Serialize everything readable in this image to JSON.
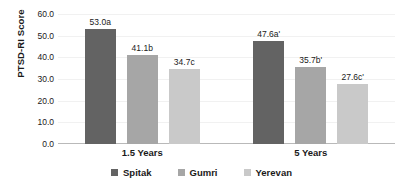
{
  "chart_data": {
    "type": "bar",
    "title": "",
    "xlabel": "",
    "ylabel": "PTSD-RI Score",
    "ylim": [
      0,
      60
    ],
    "ytick_step": 10,
    "ytick_labels": [
      "0.0",
      "10.0",
      "20.0",
      "30.0",
      "40.0",
      "50.0",
      "60.0"
    ],
    "grid": true,
    "legend_position": "bottom",
    "categories": [
      "1.5 Years",
      "5 Years"
    ],
    "series": [
      {
        "name": "Spitak",
        "color": "#636363",
        "values": [
          53.0,
          47.6
        ],
        "labels": [
          "53.0a",
          "47.6a'"
        ]
      },
      {
        "name": "Gumri",
        "color": "#a6a6a6",
        "values": [
          41.1,
          35.7
        ],
        "labels": [
          "41.1b",
          "35.7b'"
        ]
      },
      {
        "name": "Yerevan",
        "color": "#c9c9c9",
        "values": [
          34.7,
          27.6
        ],
        "labels": [
          "34.7c",
          "27.6c'"
        ]
      }
    ]
  },
  "axis": {
    "y_title": "PTSD-RI Score"
  },
  "legend": {
    "items": [
      {
        "label": "Spitak",
        "color": "#636363"
      },
      {
        "label": "Gumri",
        "color": "#a6a6a6"
      },
      {
        "label": "Yerevan",
        "color": "#c9c9c9"
      }
    ]
  }
}
